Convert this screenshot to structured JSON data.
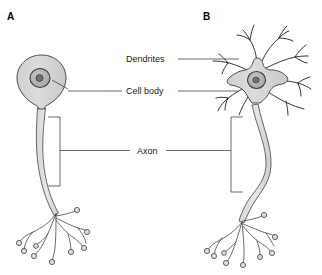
{
  "figure": {
    "background_color": "#ffffff",
    "panels": [
      {
        "letter": "A",
        "name": "unipolar-neuron",
        "description": "Neuron with teardrop-shaped cell body, single long axon and branched axon terminals"
      },
      {
        "letter": "B",
        "name": "multipolar-neuron",
        "description": "Neuron with star-shaped cell body, many branching dendrites, curved axon and branched axon terminals"
      }
    ],
    "labels": [
      {
        "id": "dendrites",
        "text": "Dendrites"
      },
      {
        "id": "cell-body",
        "text": "Cell body"
      },
      {
        "id": "axon",
        "text": "Axon"
      }
    ],
    "colors": {
      "soma_fill": "#d4d4d4",
      "nucleus_fill": "#b4b4b4",
      "nucleolus_fill": "#6a6a6a",
      "outline": "#3a3a3a",
      "dendrite_stroke": "#1e1e1e",
      "leader_line": "#2b2b2b",
      "text": "#1a1a1a",
      "background": "#ffffff"
    }
  }
}
